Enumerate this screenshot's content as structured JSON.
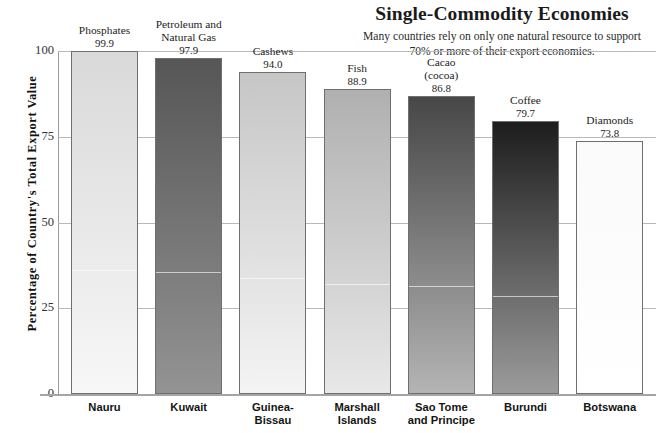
{
  "header": {
    "title": "Single-Commodity Economies",
    "subtitle": "Many countries rely on only one natural resource to support 70% or more of their export economies."
  },
  "axes": {
    "y_title": "Percentage of Country's Total Export Value",
    "y_ticks": [
      "100",
      "75",
      "50",
      "25",
      "0"
    ]
  },
  "chart_data": {
    "type": "bar",
    "title": "Single-Commodity Economies",
    "subtitle": "Many countries rely on only one natural resource to support 70% or more of their export economies.",
    "xlabel": "",
    "ylabel": "Percentage of Country's Total Export Value",
    "ylim": [
      0,
      100
    ],
    "yticks": [
      0,
      25,
      50,
      75,
      100
    ],
    "grid": true,
    "legend": false,
    "categories": [
      "Nauru",
      "Kuwait",
      "Guinea-Bissau",
      "Marshall Islands",
      "Sao Tome and Principe",
      "Burundi",
      "Botswana"
    ],
    "values": [
      99.9,
      97.9,
      94.0,
      88.9,
      86.8,
      79.7,
      73.8
    ],
    "point_labels": [
      "Phosphates",
      "Petroleum and Natural Gas",
      "Cashews",
      "Fish",
      "Cacao (cocoa)",
      "Coffee",
      "Diamonds"
    ],
    "bars": [
      {
        "country": "Nauru",
        "country_lines": [
          "Nauru"
        ],
        "commodity_lines": [
          "Phosphates"
        ],
        "value": 99.9,
        "value_label": "99.9",
        "color_top": "#d9d9d9",
        "color_bottom": "#f7f7f7"
      },
      {
        "country": "Kuwait",
        "country_lines": [
          "Kuwait"
        ],
        "commodity_lines": [
          "Petroleum and",
          "Natural Gas"
        ],
        "value": 97.9,
        "value_label": "97.9",
        "color_top": "#565656",
        "color_bottom": "#939393"
      },
      {
        "country": "Guinea-Bissau",
        "country_lines": [
          "Guinea-",
          "Bissau"
        ],
        "commodity_lines": [
          "Cashews"
        ],
        "value": 94.0,
        "value_label": "94.0",
        "color_top": "#c6c6c6",
        "color_bottom": "#f4f4f4"
      },
      {
        "country": "Marshall Islands",
        "country_lines": [
          "Marshall",
          "Islands"
        ],
        "commodity_lines": [
          "Fish"
        ],
        "value": 88.9,
        "value_label": "88.9",
        "color_top": "#b0b0b0",
        "color_bottom": "#e8e8e8"
      },
      {
        "country": "Sao Tome and Principe",
        "country_lines": [
          "Sao Tome",
          "and Principe"
        ],
        "commodity_lines": [
          "Cacao",
          "(cocoa)"
        ],
        "value": 86.8,
        "value_label": "86.8",
        "color_top": "#474747",
        "color_bottom": "#b4b4b4"
      },
      {
        "country": "Burundi",
        "country_lines": [
          "Burundi"
        ],
        "commodity_lines": [
          "Coffee"
        ],
        "value": 79.7,
        "value_label": "79.7",
        "color_top": "#1d1d1d",
        "color_bottom": "#9b9b9b"
      },
      {
        "country": "Botswana",
        "country_lines": [
          "Botswana"
        ],
        "commodity_lines": [
          "Diamonds"
        ],
        "value": 73.8,
        "value_label": "73.8",
        "color_top": "#fafafa",
        "color_bottom": "#ffffff"
      }
    ]
  },
  "style": {
    "gridline_color": "#b9b9b9",
    "axis_color": "#9a9a9a",
    "bar_border_color": "#6f6f6f",
    "background": "#ffffff"
  }
}
